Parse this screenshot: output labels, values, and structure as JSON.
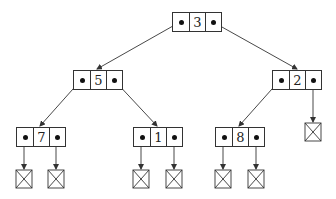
{
  "diagram": {
    "type": "binary-tree-linked-nodes",
    "nodes": [
      {
        "id": "n3",
        "value": "3",
        "x": 172,
        "y": 12
      },
      {
        "id": "n5",
        "value": "5",
        "x": 73,
        "y": 70
      },
      {
        "id": "n2",
        "value": "2",
        "x": 272,
        "y": 70
      },
      {
        "id": "n7",
        "value": "7",
        "x": 16,
        "y": 127
      },
      {
        "id": "n1",
        "value": "1",
        "x": 133,
        "y": 127
      },
      {
        "id": "n8",
        "value": "8",
        "x": 215,
        "y": 127
      }
    ],
    "edges": [
      {
        "from": "n3",
        "side": "left",
        "to": "n5"
      },
      {
        "from": "n3",
        "side": "right",
        "to": "n2"
      },
      {
        "from": "n5",
        "side": "left",
        "to": "n7"
      },
      {
        "from": "n5",
        "side": "right",
        "to": "n1"
      },
      {
        "from": "n2",
        "side": "left",
        "to": "n8"
      },
      {
        "from": "n2",
        "side": "right",
        "to": "null"
      },
      {
        "from": "n7",
        "side": "left",
        "to": "null"
      },
      {
        "from": "n7",
        "side": "right",
        "to": "null"
      },
      {
        "from": "n1",
        "side": "left",
        "to": "null"
      },
      {
        "from": "n1",
        "side": "right",
        "to": "null"
      },
      {
        "from": "n8",
        "side": "left",
        "to": "null"
      },
      {
        "from": "n8",
        "side": "right",
        "to": "null"
      }
    ],
    "null_symbol": "crossed-box"
  }
}
